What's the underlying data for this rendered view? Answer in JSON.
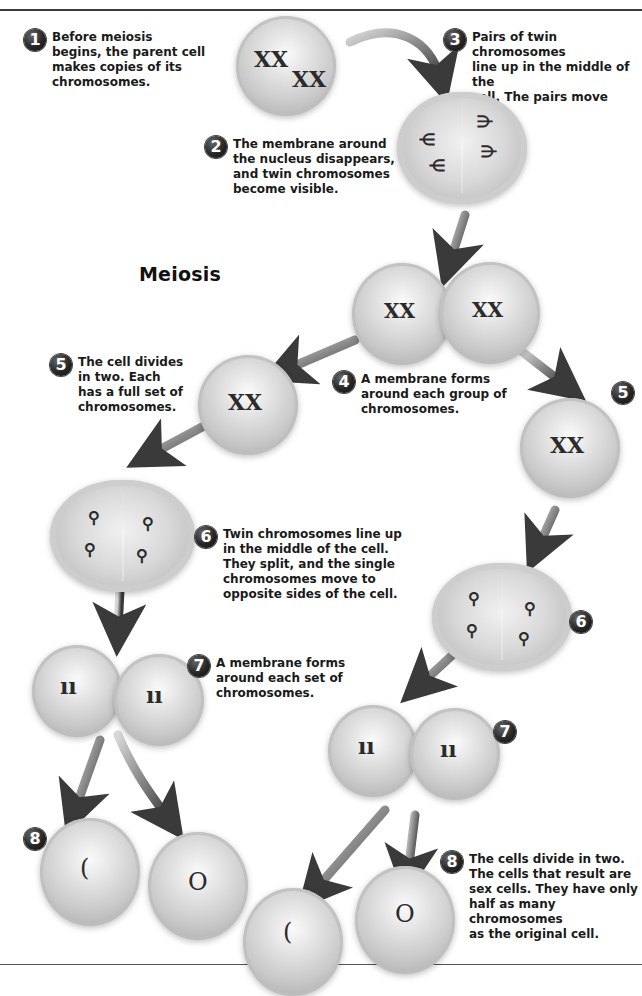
{
  "title": "Meiosis",
  "steps": [
    {
      "number": "1",
      "text": "Before meiosis\nbegins, the parent cell\nmakes copies of its\nchromosomes."
    },
    {
      "number": "2",
      "text": "The membrane around\nthe nucleus disappears,\nand twin chromosomes\nbecome visible."
    },
    {
      "number": "3",
      "text": "Pairs of twin chromosomes\nline up in the middle of the\ncell. The pairs move apart."
    },
    {
      "number": "4",
      "text": "A membrane forms\naround each group of\nchromosomes."
    },
    {
      "number": "5",
      "text": "The cell divides\nin two. Each\nhas a full set of\nchromosomes."
    },
    {
      "number": "6",
      "text": "Twin chromosomes line up\nin the middle of the cell.\nThey split, and the single\nchromosomes move to\nopposite sides of the cell."
    },
    {
      "number": "7",
      "text": "A membrane forms\naround each set of\nchromosomes."
    },
    {
      "number": "8",
      "text": "The cells divide in two.\nThe cells that result are\nsex cells. They have only\nhalf as many chromosomes\nas the original cell."
    }
  ],
  "extra_badges": {
    "right_5": "5",
    "right_6": "6",
    "right_7": "7",
    "left_8": "8"
  },
  "chromosome_glyphs": {
    "x_pair": "XX",
    "single_pair": "ıı",
    "loop": "ʘ"
  },
  "colors": {
    "background": "#ffffff",
    "text": "#1a1a1a",
    "badge": "#262626",
    "cell_light": "#f2f2f2",
    "cell_dark": "#b2b2b2",
    "arrow": "#4a4a4a",
    "rule": "#3c3c3c"
  }
}
